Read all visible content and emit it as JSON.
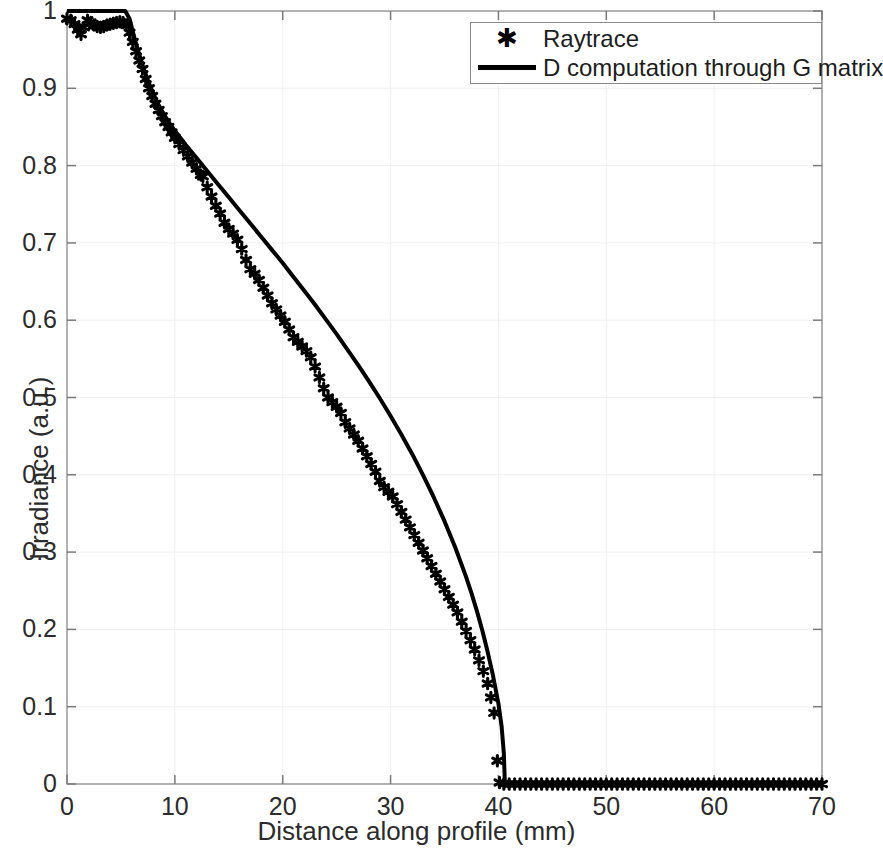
{
  "chart_data": {
    "type": "line",
    "title": "",
    "xlabel": "Distance along profile (mm)",
    "ylabel": "Irradiance (a.u.)",
    "xlim": [
      0,
      70
    ],
    "ylim": [
      0,
      1
    ],
    "xticks": [
      0,
      10,
      20,
      30,
      40,
      50,
      60,
      70
    ],
    "yticks": [
      0,
      0.1,
      0.2,
      0.3,
      0.4,
      0.5,
      0.6,
      0.7,
      0.8,
      0.9,
      1
    ],
    "xtick_labels": [
      "0",
      "10",
      "20",
      "30",
      "40",
      "50",
      "60",
      "70"
    ],
    "ytick_labels": [
      "0",
      "0.1",
      "0.2",
      "0.3",
      "0.4",
      "0.5",
      "0.6",
      "0.7",
      "0.8",
      "0.9",
      "1"
    ],
    "grid": true,
    "grid_color": "#f0f0f0",
    "legend_position": "top-right",
    "series": [
      {
        "name": "Raytrace",
        "style": "markers",
        "marker": "asterisk",
        "color": "#000000",
        "points": [
          [
            0.0,
            0.99
          ],
          [
            0.35,
            0.988
          ],
          [
            0.7,
            0.983
          ],
          [
            1.0,
            0.976
          ],
          [
            1.3,
            0.97
          ],
          [
            1.6,
            0.979
          ],
          [
            1.9,
            0.988
          ],
          [
            2.2,
            0.985
          ],
          [
            2.5,
            0.982
          ],
          [
            2.8,
            0.98
          ],
          [
            3.1,
            0.979
          ],
          [
            3.4,
            0.98
          ],
          [
            3.7,
            0.982
          ],
          [
            4.0,
            0.983
          ],
          [
            4.3,
            0.984
          ],
          [
            4.6,
            0.985
          ],
          [
            4.9,
            0.986
          ],
          [
            5.2,
            0.985
          ],
          [
            5.5,
            0.982
          ],
          [
            5.8,
            0.972
          ],
          [
            6.1,
            0.96
          ],
          [
            6.4,
            0.948
          ],
          [
            6.7,
            0.936
          ],
          [
            7.0,
            0.925
          ],
          [
            7.3,
            0.912
          ],
          [
            7.6,
            0.9
          ],
          [
            7.9,
            0.89
          ],
          [
            8.2,
            0.88
          ],
          [
            8.5,
            0.872
          ],
          [
            8.8,
            0.864
          ],
          [
            9.1,
            0.856
          ],
          [
            9.4,
            0.85
          ],
          [
            9.7,
            0.843
          ],
          [
            10.0,
            0.836
          ],
          [
            10.4,
            0.828
          ],
          [
            10.8,
            0.82
          ],
          [
            11.2,
            0.812
          ],
          [
            11.6,
            0.804
          ],
          [
            12.0,
            0.796
          ],
          [
            12.4,
            0.788
          ],
          [
            12.6,
            0.786
          ],
          [
            13.0,
            0.772
          ],
          [
            13.4,
            0.76
          ],
          [
            13.8,
            0.748
          ],
          [
            14.2,
            0.738
          ],
          [
            14.6,
            0.726
          ],
          [
            15.0,
            0.718
          ],
          [
            15.4,
            0.712
          ],
          [
            15.8,
            0.704
          ],
          [
            16.2,
            0.692
          ],
          [
            16.6,
            0.678
          ],
          [
            17.0,
            0.666
          ],
          [
            17.4,
            0.66
          ],
          [
            17.8,
            0.652
          ],
          [
            18.2,
            0.642
          ],
          [
            18.6,
            0.632
          ],
          [
            19.0,
            0.622
          ],
          [
            19.4,
            0.614
          ],
          [
            19.8,
            0.606
          ],
          [
            20.2,
            0.598
          ],
          [
            20.6,
            0.588
          ],
          [
            21.0,
            0.578
          ],
          [
            21.4,
            0.572
          ],
          [
            21.8,
            0.566
          ],
          [
            22.2,
            0.56
          ],
          [
            22.6,
            0.552
          ],
          [
            23.0,
            0.54
          ],
          [
            23.4,
            0.526
          ],
          [
            23.8,
            0.512
          ],
          [
            24.2,
            0.5
          ],
          [
            24.6,
            0.494
          ],
          [
            25.0,
            0.488
          ],
          [
            25.4,
            0.48
          ],
          [
            25.8,
            0.468
          ],
          [
            26.2,
            0.46
          ],
          [
            26.6,
            0.452
          ],
          [
            27.0,
            0.444
          ],
          [
            27.4,
            0.434
          ],
          [
            27.8,
            0.424
          ],
          [
            28.2,
            0.414
          ],
          [
            28.6,
            0.404
          ],
          [
            29.0,
            0.392
          ],
          [
            29.4,
            0.384
          ],
          [
            29.8,
            0.378
          ],
          [
            30.2,
            0.372
          ],
          [
            30.6,
            0.362
          ],
          [
            31.0,
            0.352
          ],
          [
            31.4,
            0.342
          ],
          [
            31.8,
            0.332
          ],
          [
            32.2,
            0.322
          ],
          [
            32.6,
            0.312
          ],
          [
            33.0,
            0.302
          ],
          [
            33.4,
            0.292
          ],
          [
            33.8,
            0.282
          ],
          [
            34.2,
            0.272
          ],
          [
            34.6,
            0.262
          ],
          [
            35.0,
            0.252
          ],
          [
            35.4,
            0.242
          ],
          [
            35.8,
            0.232
          ],
          [
            36.2,
            0.222
          ],
          [
            36.6,
            0.21
          ],
          [
            37.0,
            0.198
          ],
          [
            37.4,
            0.186
          ],
          [
            37.8,
            0.174
          ],
          [
            38.2,
            0.16
          ],
          [
            38.6,
            0.146
          ],
          [
            39.0,
            0.13
          ],
          [
            39.3,
            0.112
          ],
          [
            39.6,
            0.092
          ],
          [
            39.9,
            0.03
          ],
          [
            40.1,
            0.002
          ],
          [
            40.5,
            0.0
          ],
          [
            41.0,
            0.0
          ],
          [
            41.5,
            0.0
          ],
          [
            42.0,
            0.0
          ],
          [
            42.5,
            0.0
          ],
          [
            43.0,
            0.0
          ],
          [
            43.5,
            0.0
          ],
          [
            44.0,
            0.0
          ],
          [
            44.5,
            0.0
          ],
          [
            45.0,
            0.0
          ],
          [
            45.5,
            0.0
          ],
          [
            46.0,
            0.0
          ],
          [
            46.5,
            0.0
          ],
          [
            47.0,
            0.0
          ],
          [
            47.5,
            0.0
          ],
          [
            48.0,
            0.0
          ],
          [
            48.5,
            0.0
          ],
          [
            49.0,
            0.0
          ],
          [
            49.5,
            0.0
          ],
          [
            50.0,
            0.0
          ],
          [
            50.5,
            0.0
          ],
          [
            51.0,
            0.0
          ],
          [
            51.5,
            0.0
          ],
          [
            52.0,
            0.0
          ],
          [
            52.5,
            0.0
          ],
          [
            53.0,
            0.0
          ],
          [
            53.5,
            0.0
          ],
          [
            54.0,
            0.0
          ],
          [
            54.5,
            0.0
          ],
          [
            55.0,
            0.0
          ],
          [
            55.5,
            0.0
          ],
          [
            56.0,
            0.0
          ],
          [
            56.5,
            0.0
          ],
          [
            57.0,
            0.0
          ],
          [
            57.5,
            0.0
          ],
          [
            58.0,
            0.0
          ],
          [
            58.5,
            0.0
          ],
          [
            59.0,
            0.0
          ],
          [
            59.5,
            0.0
          ],
          [
            60.0,
            0.0
          ],
          [
            60.5,
            0.0
          ],
          [
            61.0,
            0.0
          ],
          [
            61.5,
            0.0
          ],
          [
            62.0,
            0.0
          ],
          [
            62.5,
            0.0
          ],
          [
            63.0,
            0.0
          ],
          [
            63.5,
            0.0
          ],
          [
            64.0,
            0.0
          ],
          [
            64.5,
            0.0
          ],
          [
            65.0,
            0.0
          ],
          [
            65.5,
            0.0
          ],
          [
            66.0,
            0.0
          ],
          [
            66.5,
            0.0
          ],
          [
            67.0,
            0.0
          ],
          [
            67.5,
            0.0
          ],
          [
            68.0,
            0.0
          ],
          [
            68.5,
            0.0
          ],
          [
            69.0,
            0.0
          ],
          [
            69.5,
            0.0
          ],
          [
            70.0,
            0.0
          ]
        ]
      },
      {
        "name": "D computation through G matrix",
        "style": "line",
        "color": "#000000",
        "linewidth": 4,
        "points": [
          [
            0.0,
            1.0
          ],
          [
            1.0,
            1.0
          ],
          [
            2.0,
            1.0
          ],
          [
            3.0,
            1.0
          ],
          [
            4.0,
            1.0
          ],
          [
            5.0,
            1.0
          ],
          [
            5.4,
            1.0
          ],
          [
            5.8,
            0.99
          ],
          [
            6.2,
            0.968
          ],
          [
            6.6,
            0.948
          ],
          [
            7.0,
            0.93
          ],
          [
            7.5,
            0.91
          ],
          [
            8.0,
            0.893
          ],
          [
            8.5,
            0.878
          ],
          [
            9.0,
            0.866
          ],
          [
            9.5,
            0.855
          ],
          [
            10.0,
            0.845
          ],
          [
            11.0,
            0.827
          ],
          [
            12.0,
            0.81
          ],
          [
            13.0,
            0.793
          ],
          [
            14.0,
            0.776
          ],
          [
            15.0,
            0.759
          ],
          [
            16.0,
            0.742
          ],
          [
            17.0,
            0.725
          ],
          [
            18.0,
            0.708
          ],
          [
            19.0,
            0.691
          ],
          [
            20.0,
            0.674
          ],
          [
            21.0,
            0.656
          ],
          [
            22.0,
            0.638
          ],
          [
            23.0,
            0.62
          ],
          [
            24.0,
            0.601
          ],
          [
            25.0,
            0.582
          ],
          [
            26.0,
            0.562
          ],
          [
            27.0,
            0.542
          ],
          [
            28.0,
            0.521
          ],
          [
            29.0,
            0.499
          ],
          [
            30.0,
            0.476
          ],
          [
            31.0,
            0.452
          ],
          [
            32.0,
            0.427
          ],
          [
            33.0,
            0.4
          ],
          [
            34.0,
            0.371
          ],
          [
            35.0,
            0.34
          ],
          [
            36.0,
            0.306
          ],
          [
            37.0,
            0.268
          ],
          [
            37.5,
            0.247
          ],
          [
            38.0,
            0.224
          ],
          [
            38.5,
            0.199
          ],
          [
            39.0,
            0.171
          ],
          [
            39.5,
            0.14
          ],
          [
            40.0,
            0.104
          ],
          [
            40.3,
            0.074
          ],
          [
            40.5,
            0.04
          ],
          [
            40.6,
            0.0
          ],
          [
            45.0,
            0.0
          ],
          [
            50.0,
            0.0
          ],
          [
            55.0,
            0.0
          ],
          [
            60.0,
            0.0
          ],
          [
            65.0,
            0.0
          ],
          [
            70.0,
            0.0
          ]
        ]
      }
    ]
  },
  "legend": {
    "entries": [
      {
        "label": "Raytrace",
        "sample": "asterisk-marker"
      },
      {
        "label": "D computation through G matrix",
        "sample": "solid-line"
      }
    ]
  },
  "axes": {
    "x_title": "Distance along profile (mm)",
    "y_title": "Irradiance (a.u.)"
  }
}
